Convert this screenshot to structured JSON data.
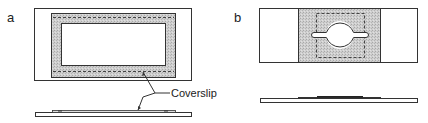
{
  "figure": {
    "panels": [
      {
        "id": "a",
        "label": "a",
        "description": "Microscope slide with rectangular coverslip frame, top and side views",
        "callout": "Coverslip"
      },
      {
        "id": "b",
        "label": "b",
        "description": "Microscope slide with coverslip having a circular aperture with side notches, top and side views"
      }
    ],
    "colors": {
      "outline": "#333333",
      "shading": "#c8c8c8",
      "background": "#ffffff",
      "coverslip_side": "#222222"
    }
  }
}
